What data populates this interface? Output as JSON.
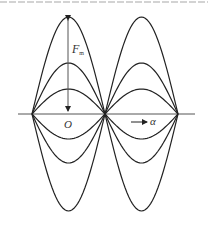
{
  "figure": {
    "type": "waveform-diagram",
    "cropped_caption_visible": true,
    "cropped_caption_note": "Chinese caption cut off at top edge; text not legible, content not transcribed"
  },
  "labels": {
    "force": "F",
    "force_subscript": "m",
    "force_subscript_note": "illegible at source resolution; may be a small CJK character such as 磁",
    "origin": "O",
    "direction": "α"
  },
  "geometry": {
    "axis": {
      "x1": 18,
      "x2": 195,
      "y": 114
    },
    "nodes_x": [
      32,
      105,
      178
    ],
    "amplitudes_up": [
      97,
      51,
      25
    ],
    "amplitudes_down": [
      25,
      49,
      97
    ],
    "arrow_x": 68
  },
  "colors": {
    "curve": "#222222",
    "axis": "#555555",
    "label": "#333333"
  }
}
